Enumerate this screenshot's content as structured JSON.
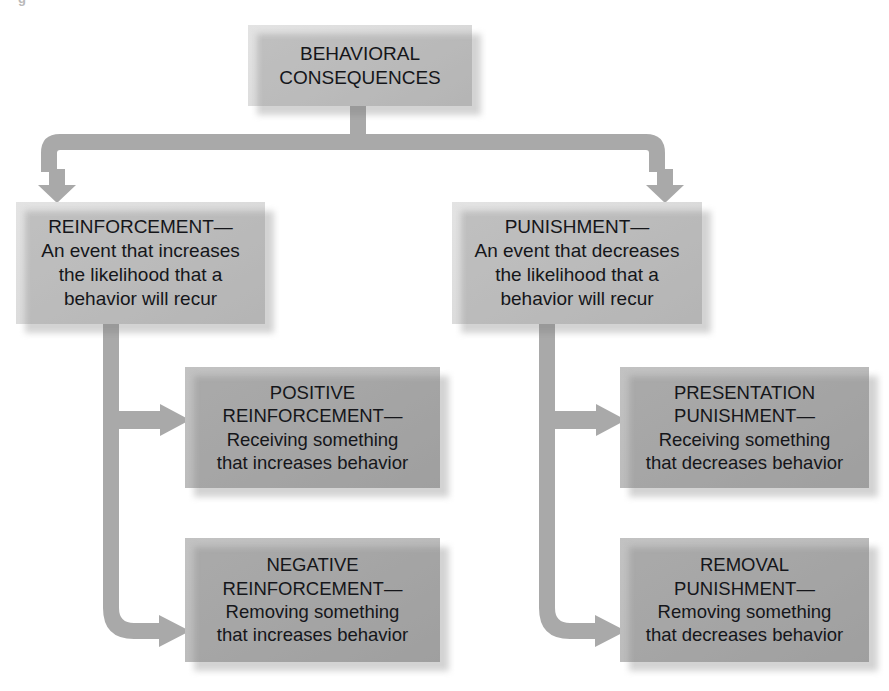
{
  "page": {
    "width": 889,
    "height": 691,
    "background": "#ffffff",
    "cropped_caption": {
      "marker": "g",
      "fragment_left": "",
      "fragment_right": ""
    }
  },
  "theme": {
    "box_fill_light": "#dcdcdc",
    "box_fill_mid": "#bcbcbc",
    "connector_color": "#a9a9a9",
    "text_color": "#15161a",
    "shadow_color": "rgba(120,120,120,0.33)"
  },
  "diagram": {
    "type": "hierarchy-flowchart",
    "title": "Behavioral Consequences",
    "levels": 3,
    "nodes": [
      {
        "id": "root",
        "level": 1,
        "style": "light",
        "lines": [
          "BEHAVIORAL",
          "CONSEQUENCES"
        ]
      },
      {
        "id": "reinforcement",
        "level": 2,
        "style": "light",
        "lines": [
          "REINFORCEMENT—",
          "An event that increases",
          "the likelihood that a",
          "behavior will recur"
        ]
      },
      {
        "id": "punishment",
        "level": 2,
        "style": "light",
        "lines": [
          "PUNISHMENT—",
          "An event that decreases",
          "the likelihood that a",
          "behavior will recur"
        ]
      },
      {
        "id": "positive-reinforcement",
        "level": 3,
        "style": "mid",
        "lines": [
          "POSITIVE",
          "REINFORCEMENT—",
          "Receiving something",
          "that increases behavior"
        ]
      },
      {
        "id": "negative-reinforcement",
        "level": 3,
        "style": "mid",
        "lines": [
          "NEGATIVE",
          "REINFORCEMENT—",
          "Removing something",
          "that increases behavior"
        ]
      },
      {
        "id": "presentation-punishment",
        "level": 3,
        "style": "mid",
        "lines": [
          "PRESENTATION",
          "PUNISHMENT—",
          "Receiving something",
          "that decreases behavior"
        ]
      },
      {
        "id": "removal-punishment",
        "level": 3,
        "style": "mid",
        "lines": [
          "REMOVAL",
          "PUNISHMENT—",
          "Removing something",
          "that decreases behavior"
        ]
      }
    ],
    "edges": [
      {
        "from": "root",
        "to": "reinforcement",
        "shape": "split-down-left",
        "arrow": "down"
      },
      {
        "from": "root",
        "to": "punishment",
        "shape": "split-down-right",
        "arrow": "down"
      },
      {
        "from": "reinforcement",
        "to": "positive-reinforcement",
        "shape": "trunk-branch-right",
        "arrow": "right"
      },
      {
        "from": "reinforcement",
        "to": "negative-reinforcement",
        "shape": "trunk-elbow-right",
        "arrow": "right"
      },
      {
        "from": "punishment",
        "to": "presentation-punishment",
        "shape": "trunk-branch-right",
        "arrow": "right"
      },
      {
        "from": "punishment",
        "to": "removal-punishment",
        "shape": "trunk-elbow-right",
        "arrow": "right"
      }
    ]
  }
}
